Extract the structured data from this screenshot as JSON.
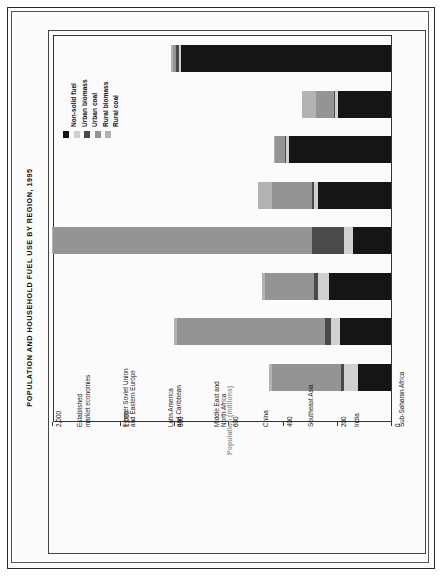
{
  "page": {
    "title": "POPULATION AND HOUSEHOLD FUEL USE BY REGION, 1995"
  },
  "colors": {
    "non_solid_fuel": "#151515",
    "urban_biomass": "#d0d0d0",
    "urban_coal": "#4a4a4a",
    "rural_biomass": "#949494",
    "rural_coal": "#b3b3b3",
    "axis": "#333333",
    "axis_title": "#9a9a9a",
    "frame": "#2a2a2a",
    "background": "#fcfcfc"
  },
  "chart_data": {
    "type": "bar",
    "orientation": "horizontal-rotated",
    "title": "POPULATION AND HOUSEHOLD FUEL USE BY REGION, 1995",
    "xlabel": "",
    "ylabel": "Population (millions)",
    "axis_title": "Population (millions)",
    "grid": false,
    "legend_position": "top-left",
    "stacked": true,
    "broken_axis": true,
    "axis_note": "Scale is compressed between 1,000 and 2,000",
    "ticks": [
      {
        "label": "0",
        "value": 0
      },
      {
        "label": "200",
        "value": 200
      },
      {
        "label": "400",
        "value": 400
      },
      {
        "label": "600",
        "value": 600
      },
      {
        "label": "800",
        "value": 800
      },
      {
        "label": "1,000",
        "value": 1000
      },
      {
        "label": "2,000",
        "value": 2000
      }
    ],
    "ylim": [
      0,
      2000
    ],
    "categories": [
      "Established market economies",
      "Former Soviet Union and Eastern Europe",
      "Latin America and Caribbean",
      "Middle East and North Africa",
      "China",
      "Southeast Asia",
      "India",
      "Sub-Saharan Africa"
    ],
    "category_lines": [
      [
        "Established",
        "market economies"
      ],
      [
        "Former Soviet Union",
        "and Eastern Europe"
      ],
      [
        "Latin America",
        "and Caribbean"
      ],
      [
        "Middle East and",
        "North Africa"
      ],
      [
        "China"
      ],
      [
        "Southeast Asia"
      ],
      [
        "India"
      ],
      [
        "Sub-Saharan Africa"
      ]
    ],
    "series": [
      {
        "name": "Non-solid fuel",
        "key": "non_solid_fuel",
        "values": [
          775,
          195,
          375,
          270,
          140,
          230,
          190,
          120
        ]
      },
      {
        "name": "Urban biomass",
        "key": "urban_biomass",
        "values": [
          8,
          10,
          12,
          15,
          35,
          40,
          30,
          55
        ]
      },
      {
        "name": "Urban coal",
        "key": "urban_coal",
        "values": [
          10,
          5,
          5,
          5,
          115,
          15,
          25,
          10
        ]
      },
      {
        "name": "Rural biomass",
        "key": "rural_biomass",
        "values": [
          12,
          65,
          35,
          150,
          1690,
          180,
          545,
          255
        ]
      },
      {
        "name": "Rural coal",
        "key": "rural_coal",
        "values": [
          5,
          55,
          5,
          50,
          20,
          10,
          10,
          10
        ]
      }
    ],
    "totals": [
      810,
      330,
      432,
      490,
      2000,
      475,
      800,
      450
    ]
  },
  "legend": {
    "items": [
      {
        "label": "Non-solid fuel",
        "color_key": "non_solid_fuel"
      },
      {
        "label": "Urban biomass",
        "color_key": "urban_biomass"
      },
      {
        "label": "Urban coal",
        "color_key": "urban_coal"
      },
      {
        "label": "Rural biomass",
        "color_key": "rural_biomass"
      },
      {
        "label": "Rural coal",
        "color_key": "rural_coal"
      }
    ]
  }
}
